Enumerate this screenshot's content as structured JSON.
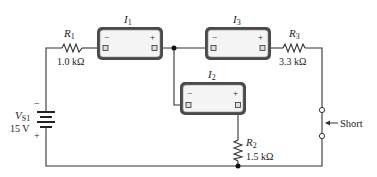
{
  "diagram": {
    "type": "circuit",
    "source": {
      "name": "V",
      "subscript": "S1",
      "value": "15 V",
      "minus": "−",
      "plus": "+"
    },
    "resistors": [
      {
        "name": "R",
        "subscript": "1",
        "value": "1.0 kΩ"
      },
      {
        "name": "R",
        "subscript": "2",
        "value": "1.5 kΩ"
      },
      {
        "name": "R",
        "subscript": "3",
        "value": "3.3 kΩ"
      }
    ],
    "meters": [
      {
        "name": "I",
        "subscript": "1",
        "minus": "−",
        "plus": "+"
      },
      {
        "name": "I",
        "subscript": "2",
        "minus": "−",
        "plus": "+"
      },
      {
        "name": "I",
        "subscript": "3",
        "minus": "−",
        "plus": "+"
      }
    ],
    "annotation": {
      "label": "Short"
    },
    "colors": {
      "wire": "#333333",
      "meter_frame": "#555555",
      "meter_face": "#f4f4f4"
    }
  }
}
